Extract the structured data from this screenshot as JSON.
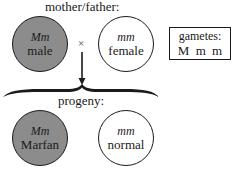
{
  "diagram": {
    "parents_label": "mother/father:",
    "cross_symbol": "×",
    "progeny_label": "progeny:",
    "parents": [
      {
        "genotype": "Mm",
        "phenotype": "male",
        "filled": true
      },
      {
        "genotype": "mm",
        "phenotype": "female",
        "filled": false
      }
    ],
    "gametes": {
      "title": "gametes:",
      "values": "M m m"
    },
    "progeny": [
      {
        "genotype": "Mm",
        "phenotype": "Marfan",
        "filled": true
      },
      {
        "genotype": "mm",
        "phenotype": "normal",
        "filled": false
      }
    ],
    "colors": {
      "affected_fill": "#8c8c8c",
      "unaffected_fill": "#ffffff",
      "stroke": "#1a1a1a"
    }
  }
}
